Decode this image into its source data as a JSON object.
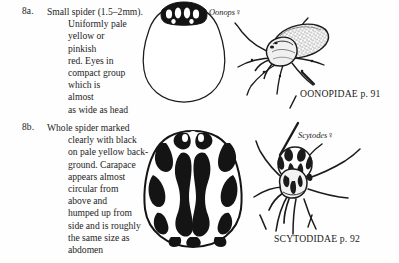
{
  "page": {
    "kind": "identification-key-page",
    "ink_color": "#1b1b1b",
    "paper_color": "#fefefe"
  },
  "entries": [
    {
      "label": "8a.",
      "first_line": "Small spider (1.5–2mm).",
      "body": "Uniformly pale\nyellow or\npinkish\nred. Eyes in\ncompact group\nwhich is\nalmost\nas wide as head",
      "genus": "Oonops",
      "sex": "♀",
      "family": "OONOPIDAE p. 91",
      "figures": [
        {
          "name": "oonops-eye-group-diagram"
        },
        {
          "name": "oonops-whole-spider-drawing"
        }
      ]
    },
    {
      "label": "8b.",
      "first_line": "Whole spider marked",
      "body": "clearly with black\non pale yellow back-\nground. Carapace\nappears almost\ncircular from\nabove and\nhumped up from\nside and is roughly\nthe same size as\nabdomen",
      "genus": "Scytodes",
      "sex": "♀",
      "family": "SCYTODIDAE p. 92",
      "figures": [
        {
          "name": "scytodes-carapace-pattern-drawing"
        },
        {
          "name": "scytodes-whole-spider-drawing"
        }
      ]
    }
  ]
}
